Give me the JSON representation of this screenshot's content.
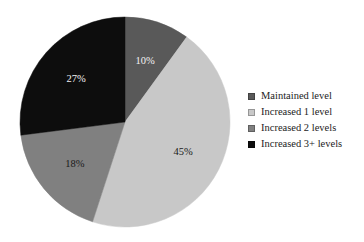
{
  "chart_data": {
    "type": "pie",
    "title": "",
    "subtitle": "",
    "xlabel": "",
    "ylabel": "",
    "grid": false,
    "legend_position": "right",
    "start_angle_deg": 0,
    "direction": "clockwise",
    "categories": [
      "Maintained level",
      "Increased 1 level",
      "Increased 2 levels",
      "Increased 3+ levels"
    ],
    "values": [
      10,
      45,
      18,
      27
    ],
    "value_unit": "%",
    "data_labels": [
      "10%",
      "45%",
      "18%",
      "27%"
    ],
    "colors": [
      "#595959",
      "#c8c8c8",
      "#808080",
      "#0d0d0d"
    ],
    "label_text_colors": [
      "#f2f2f2",
      "#1a1a1a",
      "#1a1a1a",
      "#f2f2f2"
    ],
    "slices": [
      {
        "label": "Maintained level",
        "value": 10,
        "display": "10%",
        "color": "#595959",
        "label_color": "light"
      },
      {
        "label": "Increased 1 level",
        "value": 45,
        "display": "45%",
        "color": "#c8c8c8",
        "label_color": "dark"
      },
      {
        "label": "Increased 2 levels",
        "value": 18,
        "display": "18%",
        "color": "#808080",
        "label_color": "dark"
      },
      {
        "label": "Increased 3+ levels",
        "value": 27,
        "display": "27%",
        "color": "#0d0d0d",
        "label_color": "light"
      }
    ]
  },
  "legend": {
    "items": [
      {
        "label": "Maintained level",
        "color": "#595959"
      },
      {
        "label": "Increased 1 level",
        "color": "#c8c8c8"
      },
      {
        "label": "Increased 2 levels",
        "color": "#808080"
      },
      {
        "label": "Increased 3+ levels",
        "color": "#0d0d0d"
      }
    ]
  },
  "geometry": {
    "center_x": 125,
    "center_y": 122,
    "radius": 105,
    "label_radius_ratio": 0.62
  }
}
